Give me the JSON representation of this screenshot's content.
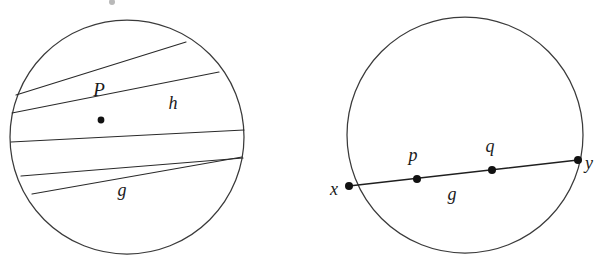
{
  "figure": {
    "caption": "",
    "background_color": "#ffffff",
    "stroke_color": "#2a2a2a",
    "label_color": "#1a1a1a",
    "width": 598,
    "height": 265
  },
  "left_diagram": {
    "name": "pencil-of-chords-through-point-P",
    "circle": {
      "cx": 127,
      "cy": 137,
      "r": 117
    },
    "center_point": {
      "label": "P",
      "x": 101,
      "y": 120
    },
    "point_label_position": {
      "x": 99,
      "y": 92
    },
    "labels": [
      {
        "id": "P",
        "text": "P",
        "x": 99,
        "y": 92,
        "size": "cap"
      },
      {
        "id": "h",
        "text": "h",
        "x": 173,
        "y": 105,
        "size": "lower"
      },
      {
        "id": "g",
        "text": "g",
        "x": 122,
        "y": 192,
        "size": "lower"
      }
    ],
    "chords": [
      {
        "id": "chord-1",
        "x1": 16,
        "y1": 95,
        "x2": 186,
        "y2": 42
      },
      {
        "id": "chord-2",
        "x1": 12,
        "y1": 113,
        "x2": 219,
        "y2": 72
      },
      {
        "id": "chord-3",
        "x1": 11,
        "y1": 142,
        "x2": 244,
        "y2": 130
      },
      {
        "id": "chord-4",
        "x1": 21,
        "y1": 176,
        "x2": 243,
        "y2": 158
      },
      {
        "id": "chord-5-g",
        "x1": 32,
        "y1": 194,
        "x2": 242,
        "y2": 157
      }
    ],
    "chord_count_left_exits": 4,
    "chord_count_right_exits": 4
  },
  "right_diagram": {
    "name": "chord-g-with-points-x-p-q-y",
    "circle": {
      "cx": 465,
      "cy": 135,
      "r": 118
    },
    "chord": {
      "id": "chord-g",
      "x1": 349,
      "y1": 186,
      "x2": 578,
      "y2": 160
    },
    "points": [
      {
        "id": "x",
        "label": "x",
        "dot_x": 349,
        "dot_y": 186,
        "label_x": 334,
        "label_y": 191
      },
      {
        "id": "p",
        "label": "p",
        "dot_x": 417,
        "dot_y": 179,
        "label_x": 413,
        "label_y": 157
      },
      {
        "id": "q",
        "label": "q",
        "dot_x": 492,
        "dot_y": 170,
        "label_x": 490,
        "label_y": 148
      },
      {
        "id": "y",
        "label": "y",
        "dot_x": 578,
        "dot_y": 160,
        "label_x": 589,
        "label_y": 165
      }
    ],
    "labels": [
      {
        "id": "g",
        "text": "g",
        "x": 452,
        "y": 196,
        "size": "lower"
      }
    ]
  },
  "artifacts": [
    {
      "id": "speck-top",
      "x": 112,
      "y": 2,
      "r": 3
    }
  ]
}
